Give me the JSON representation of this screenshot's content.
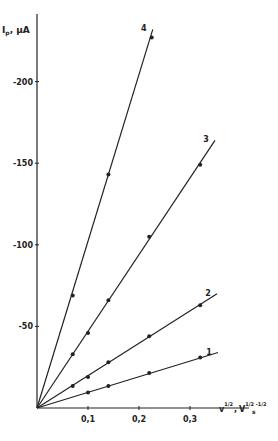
{
  "chart_data": {
    "type": "line",
    "title": "",
    "ylabel": "I_p, µA",
    "xlabel": "v^1/2, V^1/2 s^-1/2",
    "xlim": [
      0,
      0.38
    ],
    "ylim": [
      0,
      230
    ],
    "y_direction": "negative values plotted upward (cathodic current)",
    "x_ticks": [
      "0,1",
      "0,2",
      "0,3"
    ],
    "x_tick_values": [
      0.1,
      0.2,
      0.3
    ],
    "y_ticks": [
      "-50",
      "-100",
      "-150",
      "-200"
    ],
    "y_tick_values": [
      -50,
      -100,
      -150,
      -200
    ],
    "grid": false,
    "legend": "inline numeric labels at line ends",
    "series": [
      {
        "name": "1",
        "x": [
          0,
          0.1,
          0.14,
          0.22,
          0.32
        ],
        "y": [
          0,
          -9.5,
          -13.5,
          -21.5,
          -31
        ],
        "line_end": [
          0.355,
          -34
        ]
      },
      {
        "name": "2",
        "x": [
          0,
          0.07,
          0.1,
          0.14,
          0.22,
          0.32
        ],
        "y": [
          0,
          -13.5,
          -19,
          -28,
          -44,
          -63
        ],
        "line_end": [
          0.353,
          -70
        ]
      },
      {
        "name": "3",
        "x": [
          0,
          0.07,
          0.1,
          0.14,
          0.22,
          0.32
        ],
        "y": [
          0,
          -33,
          -46,
          -66,
          -105,
          -149
        ],
        "line_end": [
          0.349,
          -164
        ]
      },
      {
        "name": "4",
        "x": [
          0,
          0.07,
          0.14,
          0.225
        ],
        "y": [
          0,
          -69,
          -143,
          -227
        ],
        "line_end": [
          0.227,
          -232
        ]
      }
    ]
  },
  "labels": {
    "y_axis": "I",
    "y_axis_sub": "p",
    "y_axis_unit": ", µA",
    "x_axis_v": "v",
    "x_axis_v_sup": "1/2",
    "x_axis_sep": ",",
    "x_axis_V": "V",
    "x_axis_V_sup": "1/2",
    "x_axis_s": "s",
    "x_axis_s_sup": "-1/2"
  }
}
